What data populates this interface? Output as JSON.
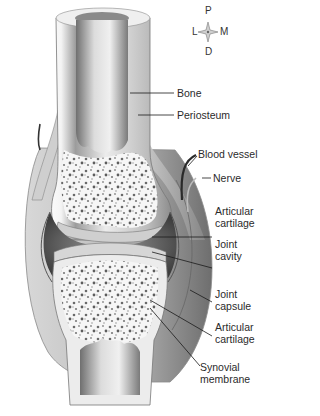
{
  "figure": {
    "compass": {
      "top": "P",
      "left": "L",
      "right": "M",
      "bottom": "D"
    },
    "labels": [
      {
        "id": "bone",
        "line1": "Bone",
        "line2": ""
      },
      {
        "id": "periosteum",
        "line1": "Periosteum",
        "line2": ""
      },
      {
        "id": "blood-vessel",
        "line1": "Blood vessel",
        "line2": ""
      },
      {
        "id": "nerve",
        "line1": "Nerve",
        "line2": ""
      },
      {
        "id": "articular-cartilage-upper",
        "line1": "Articular",
        "line2": "cartilage"
      },
      {
        "id": "joint-cavity",
        "line1": "Joint",
        "line2": "cavity"
      },
      {
        "id": "joint-capsule",
        "line1": "Joint",
        "line2": "capsule"
      },
      {
        "id": "articular-cartilage-lower",
        "line1": "Articular",
        "line2": "cartilage"
      },
      {
        "id": "synovial-membrane",
        "line1": "Synovial",
        "line2": "membrane"
      }
    ],
    "colors": {
      "background": "#ffffff",
      "bone_shaft": "#d9d9d9",
      "spongy_bone": "#f2f2f2",
      "capsule": "#9a9a9a",
      "cavity": "#4a4a4a",
      "leader_line": "#1a1a1a",
      "text": "#2b2b2b"
    }
  }
}
